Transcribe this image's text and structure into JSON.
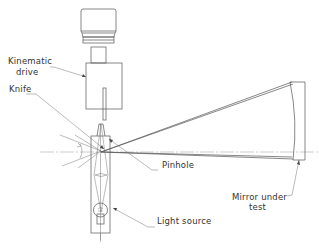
{
  "diagram": {
    "type": "optical-schematic",
    "labels": {
      "kinematic_drive_line1": "Kinematic",
      "kinematic_drive_line2": "drive",
      "knife": "Knife",
      "pinhole": "Pinhole",
      "mirror_line1": "Mirror under",
      "mirror_line2": "test",
      "light_source": "Light source"
    },
    "colors": {
      "line": "#555555",
      "text": "#333333",
      "background": "#ffffff"
    }
  }
}
